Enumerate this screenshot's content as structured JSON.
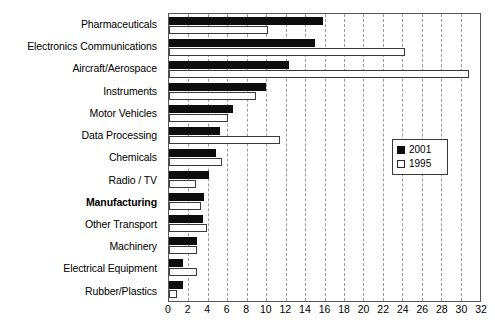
{
  "chart_data": {
    "type": "bar",
    "orientation": "horizontal",
    "title": "",
    "subtitle": "",
    "xlabel": "",
    "ylabel": "",
    "xlim": [
      0,
      32
    ],
    "xticks": [
      0,
      2,
      4,
      6,
      8,
      10,
      12,
      14,
      16,
      18,
      20,
      22,
      24,
      26,
      28,
      30,
      32
    ],
    "grid": "vertical-dashed",
    "legend_position": "middle-right",
    "categories": [
      "Pharmaceuticals",
      "Electronics Communications",
      "Aircraft/Aerospace",
      "Instruments",
      "Motor Vehicles",
      "Data Processing",
      "Chemicals",
      "Radio / TV",
      "Manufacturing",
      "Other Transport",
      "Machinery",
      "Electrical Equipment",
      "Rubber/Plastics"
    ],
    "emphasized_categories": [
      "Manufacturing"
    ],
    "series": [
      {
        "name": "2001",
        "color": "#0d0d0d",
        "style": "filled",
        "values": [
          15.8,
          15.0,
          12.3,
          10.0,
          6.6,
          5.2,
          4.8,
          4.1,
          3.6,
          3.5,
          2.9,
          1.4,
          1.4
        ]
      },
      {
        "name": "1995",
        "color": "#ffffff",
        "style": "hollow",
        "values": [
          10.2,
          24.3,
          30.9,
          9.0,
          6.1,
          11.4,
          5.5,
          2.8,
          3.3,
          3.9,
          2.9,
          2.9,
          0.8
        ]
      }
    ]
  },
  "legend": {
    "entries": [
      {
        "label": "2001",
        "swatch": "filled-black-square"
      },
      {
        "label": "1995",
        "swatch": "hollow-white-square"
      }
    ]
  }
}
